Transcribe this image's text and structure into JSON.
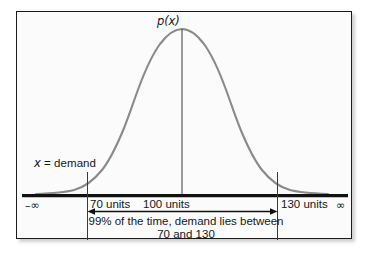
{
  "figure": {
    "type": "statistical-diagram",
    "background_color": "#fbfbfb",
    "frame_color": "#1c1c1c",
    "curve_color": "#8a8a8a",
    "axis_color": "#111111"
  },
  "labels": {
    "density_function": "p(x)",
    "axis_variable": "x = demand",
    "tick_70": "70 units",
    "tick_100": "100 units",
    "tick_130": "130 units",
    "negative_infinity": "–∞",
    "positive_infinity": "∞"
  },
  "caption": {
    "line1": "99% of the time, demand lies between",
    "line2": "70 and 130"
  },
  "chart_data": {
    "type": "line",
    "title": "",
    "subtitle": "",
    "xlabel": "x = demand",
    "ylabel": "p(x)",
    "xlim": [
      40,
      160
    ],
    "ylim": [
      0,
      1
    ],
    "grid": false,
    "legend_position": "none",
    "distribution": {
      "name": "normal",
      "mean": 100,
      "units": "units",
      "interval_confidence_percent": 99,
      "interval_lower": 70,
      "interval_upper": 130
    },
    "tick_labels": [
      "70 units",
      "100 units",
      "130 units"
    ],
    "tick_values": [
      70,
      100,
      130
    ],
    "axis_end_labels": [
      "–∞",
      "∞"
    ],
    "annotations": [
      {
        "text": "p(x)",
        "at_x": 100,
        "role": "curve-label"
      },
      {
        "text": "x = demand",
        "at_x": 58,
        "role": "axis-label"
      },
      {
        "text": "99% of the time, demand lies between 70 and 130",
        "role": "interval-caption"
      }
    ],
    "series": [
      {
        "name": "p(x)",
        "x": [
          40,
          44,
          48,
          52,
          56,
          60,
          64,
          68,
          72,
          76,
          80,
          84,
          88,
          92,
          96,
          100,
          104,
          108,
          112,
          116,
          120,
          124,
          128,
          132,
          136,
          140,
          144,
          148,
          152,
          156,
          160
        ],
        "values": [
          0.005,
          0.009,
          0.016,
          0.027,
          0.045,
          0.072,
          0.111,
          0.165,
          0.236,
          0.324,
          0.428,
          0.542,
          0.656,
          0.765,
          0.855,
          0.92,
          0.957,
          0.957,
          0.92,
          0.855,
          0.765,
          0.656,
          0.542,
          0.428,
          0.324,
          0.236,
          0.165,
          0.111,
          0.072,
          0.045,
          0.027
        ]
      }
    ]
  }
}
